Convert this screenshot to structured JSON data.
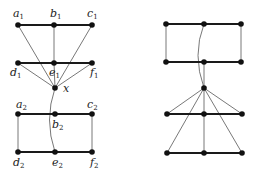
{
  "style": {
    "node_color": "#111111",
    "thick_edge_color": "#1a1a1a",
    "thin_edge_color": "#555555"
  },
  "left_graph": {
    "nodes": [
      {
        "id": "a1",
        "base": "a",
        "sub": "1",
        "x": 18,
        "y": 25,
        "lx": 13,
        "ly": 8
      },
      {
        "id": "b1",
        "base": "b",
        "sub": "1",
        "x": 54,
        "y": 25,
        "lx": 50,
        "ly": 8
      },
      {
        "id": "c1",
        "base": "c",
        "sub": "1",
        "x": 92,
        "y": 25,
        "lx": 87,
        "ly": 8
      },
      {
        "id": "d1",
        "base": "d",
        "sub": "1",
        "x": 18,
        "y": 63,
        "lx": 10,
        "ly": 67
      },
      {
        "id": "e1",
        "base": "e",
        "sub": "1",
        "x": 54,
        "y": 63,
        "lx": 49,
        "ly": 67
      },
      {
        "id": "f1",
        "base": "f",
        "sub": "1",
        "x": 92,
        "y": 63,
        "lx": 90,
        "ly": 67
      },
      {
        "id": "x",
        "base": "x",
        "sub": "",
        "x": 55,
        "y": 88,
        "lx": 63,
        "ly": 83
      },
      {
        "id": "a2",
        "base": "a",
        "sub": "2",
        "x": 18,
        "y": 114,
        "lx": 16,
        "ly": 99
      },
      {
        "id": "b2",
        "base": "b",
        "sub": "2",
        "x": 55,
        "y": 114,
        "lx": 52,
        "ly": 119
      },
      {
        "id": "c2",
        "base": "c",
        "sub": "2",
        "x": 92,
        "y": 114,
        "lx": 87,
        "ly": 99
      },
      {
        "id": "d2",
        "base": "d",
        "sub": "2",
        "x": 18,
        "y": 152,
        "lx": 13,
        "ly": 157
      },
      {
        "id": "e2",
        "base": "e",
        "sub": "2",
        "x": 55,
        "y": 152,
        "lx": 52,
        "ly": 157
      },
      {
        "id": "f2",
        "base": "f",
        "sub": "2",
        "x": 92,
        "y": 152,
        "lx": 90,
        "ly": 157
      }
    ],
    "thick_edges": [
      [
        "a1",
        "b1"
      ],
      [
        "b1",
        "c1"
      ],
      [
        "d1",
        "e1"
      ],
      [
        "e1",
        "f1"
      ],
      [
        "a2",
        "b2"
      ],
      [
        "b2",
        "c2"
      ],
      [
        "d2",
        "e2"
      ],
      [
        "e2",
        "f2"
      ]
    ],
    "thin_edges": [
      [
        "b1",
        "e1"
      ],
      [
        "a1",
        "x"
      ],
      [
        "c1",
        "x"
      ],
      [
        "d1",
        "x"
      ],
      [
        "e1",
        "x"
      ],
      [
        "f1",
        "x"
      ],
      [
        "a2",
        "d2"
      ],
      [
        "c2",
        "f2"
      ]
    ],
    "curved_edges": [
      {
        "from": "x",
        "to": "e2",
        "cx": 44,
        "cy": 120
      }
    ]
  },
  "right_graph": {
    "nodes": [
      {
        "id": "r1",
        "x": 166,
        "y": 24
      },
      {
        "id": "r2",
        "x": 204,
        "y": 24
      },
      {
        "id": "r3",
        "x": 241,
        "y": 24
      },
      {
        "id": "r4",
        "x": 166,
        "y": 62
      },
      {
        "id": "r5",
        "x": 204,
        "y": 62
      },
      {
        "id": "r6",
        "x": 241,
        "y": 62
      },
      {
        "id": "r7",
        "x": 204,
        "y": 88
      },
      {
        "id": "r8",
        "x": 167,
        "y": 114
      },
      {
        "id": "r9",
        "x": 204,
        "y": 114
      },
      {
        "id": "r10",
        "x": 242,
        "y": 114
      },
      {
        "id": "r11",
        "x": 167,
        "y": 153
      },
      {
        "id": "r12",
        "x": 204,
        "y": 153
      },
      {
        "id": "r13",
        "x": 242,
        "y": 153
      }
    ],
    "thick_edges": [
      [
        "r1",
        "r2"
      ],
      [
        "r2",
        "r3"
      ],
      [
        "r4",
        "r5"
      ],
      [
        "r5",
        "r6"
      ],
      [
        "r8",
        "r9"
      ],
      [
        "r9",
        "r10"
      ],
      [
        "r11",
        "r12"
      ],
      [
        "r12",
        "r13"
      ]
    ],
    "thin_edges": [
      [
        "r1",
        "r4"
      ],
      [
        "r3",
        "r6"
      ],
      [
        "r5",
        "r7"
      ],
      [
        "r7",
        "r8"
      ],
      [
        "r7",
        "r9"
      ],
      [
        "r7",
        "r10"
      ],
      [
        "r7",
        "r11"
      ],
      [
        "r7",
        "r13"
      ],
      [
        "r9",
        "r12"
      ]
    ],
    "curved_edges": [
      {
        "from": "r2",
        "to": "r7",
        "cx": 192,
        "cy": 55
      }
    ]
  }
}
